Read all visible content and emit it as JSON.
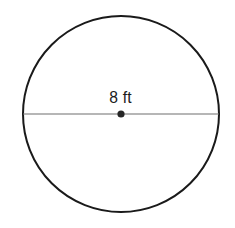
{
  "figure": {
    "type": "circle-with-diameter",
    "background_color": "#ffffff",
    "circle": {
      "name": "circle-outline",
      "center_x": 121,
      "center_y": 114,
      "radius": 98,
      "stroke_color": "#1a1a1a",
      "stroke_width": 2,
      "fill": "none"
    },
    "diameter_line": {
      "name": "diameter-line",
      "x1": 23,
      "y1": 114,
      "x2": 219,
      "y2": 114,
      "stroke_color": "#6e6e6e",
      "stroke_width": 1.2
    },
    "center_point": {
      "name": "center-dot",
      "cx": 121,
      "cy": 114,
      "radius": 3.6,
      "fill_color": "#262626"
    },
    "label": {
      "text": "8 ft",
      "value": 8,
      "unit": "ft",
      "measures": "diameter",
      "color": "#1c1c1c",
      "font_size_px": 17,
      "x": 120,
      "y": 89
    }
  }
}
